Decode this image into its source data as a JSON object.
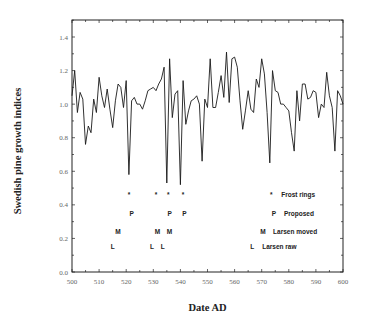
{
  "chart_data": {
    "type": "line",
    "title": "",
    "xlabel": "Date AD",
    "ylabel": "Swedish pine growth indices",
    "xlim": [
      500,
      600
    ],
    "ylim": [
      0.0,
      1.5
    ],
    "xticks": [
      500,
      510,
      520,
      530,
      540,
      550,
      560,
      570,
      580,
      590,
      600
    ],
    "xtick_labels": [
      "500",
      "510",
      "520",
      "530",
      "540",
      "550",
      "560",
      "570",
      "580",
      "590",
      "600"
    ],
    "yticks": [
      0.0,
      0.2,
      0.4,
      0.6,
      0.8,
      1.0,
      1.2,
      1.4
    ],
    "ytick_labels": [
      "0.0",
      "0.2",
      "0.4",
      "0.6",
      "0.8",
      "1.0",
      "1.2",
      "1.4"
    ],
    "grid": false,
    "series": [
      {
        "name": "Swedish pine growth indices",
        "x": [
          500,
          501,
          502,
          503,
          504,
          505,
          506,
          507,
          508,
          509,
          510,
          511,
          512,
          513,
          514,
          515,
          516,
          517,
          518,
          519,
          520,
          521,
          522,
          523,
          524,
          525,
          526,
          527,
          528,
          529,
          530,
          531,
          532,
          533,
          534,
          535,
          536,
          537,
          538,
          539,
          540,
          541,
          542,
          543,
          544,
          545,
          546,
          547,
          548,
          549,
          550,
          551,
          552,
          553,
          554,
          555,
          556,
          557,
          558,
          559,
          560,
          561,
          562,
          563,
          564,
          565,
          566,
          567,
          568,
          569,
          570,
          571,
          572,
          573,
          574,
          575,
          576,
          577,
          578,
          579,
          580,
          581,
          582,
          583,
          584,
          585,
          586,
          587,
          588,
          589,
          590,
          591,
          592,
          593,
          594,
          595,
          596,
          597,
          598,
          599,
          600
        ],
        "values": [
          1.05,
          1.2,
          0.95,
          1.07,
          1.03,
          0.76,
          0.87,
          0.83,
          1.03,
          0.95,
          1.16,
          1.05,
          0.98,
          1.09,
          0.97,
          0.86,
          1.02,
          1.12,
          1.1,
          0.98,
          1.14,
          0.58,
          1.02,
          1.04,
          1.0,
          1.0,
          0.97,
          1.02,
          1.08,
          1.09,
          1.1,
          1.08,
          1.12,
          1.15,
          1.22,
          0.53,
          1.27,
          0.92,
          1.06,
          1.08,
          0.52,
          1.14,
          0.88,
          0.96,
          1.02,
          1.03,
          1.05,
          1.0,
          0.66,
          1.03,
          0.98,
          1.27,
          0.98,
          0.98,
          1.07,
          1.17,
          1.04,
          1.31,
          1.01,
          1.27,
          1.28,
          1.22,
          1.02,
          0.85,
          0.96,
          1.08,
          0.97,
          0.95,
          1.15,
          1.1,
          1.27,
          1.18,
          0.95,
          0.65,
          1.2,
          1.08,
          1.07,
          1.0,
          1.0,
          0.98,
          0.96,
          0.83,
          0.72,
          1.08,
          0.9,
          1.12,
          1.12,
          1.03,
          1.04,
          1.08,
          1.07,
          0.92,
          1.0,
          0.98,
          1.19,
          1.05,
          0.98,
          0.72,
          1.08,
          1.05,
          1.0
        ]
      }
    ],
    "annotations": [
      {
        "name": "Frost rings",
        "symbol": "*",
        "y": 0.46,
        "years": [
          521,
          531,
          535.5,
          541
        ]
      },
      {
        "name": "Proposed",
        "symbol": "P",
        "y": 0.35,
        "years": [
          522,
          536,
          541.5
        ]
      },
      {
        "name": "Larsen moved",
        "symbol": "M",
        "y": 0.24,
        "years": [
          517,
          531.5,
          536
        ]
      },
      {
        "name": "Larsen raw",
        "symbol": "L",
        "y": 0.15,
        "years": [
          515,
          529.5,
          533.5
        ]
      }
    ],
    "legend": {
      "position": "lower-right-inside",
      "entries": [
        {
          "symbol": "*",
          "label": "Frost rings",
          "symbol_year": 573.5,
          "y": 0.46
        },
        {
          "symbol": "P",
          "label": "Proposed",
          "symbol_year": 574.5,
          "y": 0.35
        },
        {
          "symbol": "M",
          "label": "Larsen moved",
          "symbol_year": 570.5,
          "y": 0.24
        },
        {
          "symbol": "L",
          "label": "Larsen raw",
          "symbol_year": 566.5,
          "y": 0.15
        }
      ]
    }
  },
  "layout": {
    "plot_left": 72,
    "plot_right": 343,
    "plot_top": 20,
    "plot_bottom": 272,
    "line_color": "#1a1a1a",
    "axis_color": "#222222"
  }
}
